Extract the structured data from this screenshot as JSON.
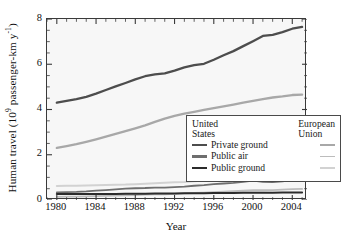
{
  "chart_data": {
    "type": "line",
    "title": "",
    "xlabel": "Year",
    "ylabel": "Human travel (10⁹ passenger-km y⁻¹)",
    "ylabel_prefix": "Human travel (10",
    "ylabel_exp": "9",
    "ylabel_suffix": " passenger-km y",
    "ylabel_exp2": "-1",
    "ylabel_end": ")",
    "xlim": [
      1979,
      2005.5
    ],
    "ylim": [
      0,
      8
    ],
    "yticks": [
      0,
      2,
      4,
      6,
      8
    ],
    "ytick_labels": [
      "0",
      "2",
      "4",
      "6",
      "8"
    ],
    "y_minor_step": 0.5,
    "xticks": [
      1980,
      1984,
      1988,
      1992,
      1996,
      2000,
      2004
    ],
    "xtick_labels": [
      "1980",
      "1984",
      "1988",
      "1992",
      "1996",
      "2000",
      "2004"
    ],
    "x_minor_step": 1,
    "grid": false,
    "plot_bg": "#f7f7f7",
    "frame_color": "#3a3a3a",
    "legend_position": "lower-right-inside",
    "x": [
      1980,
      1981,
      1982,
      1983,
      1984,
      1985,
      1986,
      1987,
      1988,
      1989,
      1990,
      1991,
      1992,
      1993,
      1994,
      1995,
      1996,
      1997,
      1998,
      1999,
      2000,
      2001,
      2002,
      2003,
      2004,
      2005
    ],
    "series": [
      {
        "name": "Private ground",
        "region": "United States",
        "key": "us_private_ground",
        "color": "#4d4d4d",
        "width": 2.3,
        "values": [
          4.3,
          4.38,
          4.46,
          4.56,
          4.7,
          4.86,
          5.02,
          5.17,
          5.33,
          5.47,
          5.55,
          5.6,
          5.72,
          5.86,
          5.96,
          6.02,
          6.2,
          6.4,
          6.58,
          6.8,
          7.02,
          7.25,
          7.3,
          7.42,
          7.57,
          7.65
        ]
      },
      {
        "name": "Private ground",
        "region": "European Union",
        "key": "eu_private_ground",
        "color": "#a8a8a8",
        "width": 2.3,
        "values": [
          2.3,
          2.38,
          2.47,
          2.57,
          2.68,
          2.8,
          2.92,
          3.04,
          3.17,
          3.3,
          3.45,
          3.6,
          3.72,
          3.82,
          3.9,
          3.98,
          4.06,
          4.14,
          4.22,
          4.3,
          4.38,
          4.46,
          4.53,
          4.58,
          4.64,
          4.66
        ]
      },
      {
        "name": "Public air",
        "region": "United States",
        "key": "us_public_air",
        "color": "#6e6e6e",
        "width": 1.8,
        "values": [
          0.34,
          0.35,
          0.36,
          0.38,
          0.41,
          0.44,
          0.47,
          0.5,
          0.52,
          0.53,
          0.55,
          0.55,
          0.57,
          0.59,
          0.63,
          0.66,
          0.7,
          0.73,
          0.76,
          0.8,
          0.86,
          0.8,
          0.79,
          0.82,
          0.88,
          0.92
        ]
      },
      {
        "name": "Public air",
        "region": "European Union",
        "key": "eu_public_air",
        "color": "#bcbcbc",
        "width": 1.8,
        "values": [
          0.14,
          0.15,
          0.15,
          0.16,
          0.17,
          0.18,
          0.19,
          0.21,
          0.22,
          0.24,
          0.25,
          0.25,
          0.27,
          0.29,
          0.31,
          0.33,
          0.35,
          0.37,
          0.39,
          0.41,
          0.43,
          0.43,
          0.44,
          0.46,
          0.48,
          0.49
        ]
      },
      {
        "name": "Public ground",
        "region": "United States",
        "key": "us_public_ground",
        "color": "#2b2b2b",
        "width": 2.0,
        "values": [
          0.26,
          0.26,
          0.26,
          0.26,
          0.27,
          0.27,
          0.27,
          0.28,
          0.28,
          0.28,
          0.29,
          0.29,
          0.29,
          0.3,
          0.3,
          0.3,
          0.31,
          0.31,
          0.31,
          0.32,
          0.32,
          0.32,
          0.32,
          0.33,
          0.33,
          0.33
        ]
      },
      {
        "name": "Public ground",
        "region": "European Union",
        "key": "eu_public_ground",
        "color": "#d2d2d2",
        "width": 2.0,
        "values": [
          0.62,
          0.63,
          0.63,
          0.64,
          0.65,
          0.66,
          0.67,
          0.68,
          0.7,
          0.72,
          0.74,
          0.76,
          0.78,
          0.8,
          0.83,
          0.86,
          0.88,
          0.9,
          0.92,
          0.94,
          0.96,
          0.97,
          0.98,
          0.99,
          1.0,
          1.0
        ]
      }
    ]
  },
  "legend": {
    "col_us_line1": "United",
    "col_us_line2": "States",
    "col_eu_line1": "European",
    "col_eu_line2": "Union",
    "rows": [
      {
        "label": "Private ground",
        "us_color": "#4d4d4d",
        "eu_color": "#a8a8a8"
      },
      {
        "label": "Public air",
        "us_color": "#6e6e6e",
        "eu_color": "#bcbcbc"
      },
      {
        "label": "Public ground",
        "us_color": "#2b2b2b",
        "eu_color": "#d2d2d2"
      }
    ]
  }
}
